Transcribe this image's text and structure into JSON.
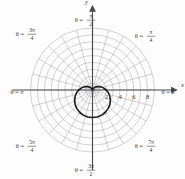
{
  "figure": {
    "kind": "polar-plot",
    "background": "#fdfdfd",
    "grid_color": "#8c8c96",
    "axis_color": "#4a4a4a",
    "curve_color": "#1a1a1a",
    "label_color": "#3a3a3a"
  },
  "axes": {
    "y_axis_label": "y",
    "x_axis_label": "x",
    "x_ticks": [
      "2",
      "4",
      "6",
      "8"
    ],
    "x_tick_values": [
      2,
      4,
      6,
      8
    ]
  },
  "angle_labels": [
    {
      "id": "theta-0",
      "text": "θ = 0",
      "angle_deg": 0,
      "value_rad": 0.0
    },
    {
      "id": "theta-pi-4",
      "text": "θ = π/4",
      "angle_deg": 45,
      "value_rad": 0.7853981634,
      "lhs": "θ =",
      "num": "π",
      "den": "4"
    },
    {
      "id": "theta-pi-2",
      "text": "θ = π/2",
      "angle_deg": 90,
      "value_rad": 1.5707963268,
      "lhs": "θ =",
      "num": "π",
      "den": "2"
    },
    {
      "id": "theta-3pi-4",
      "text": "θ = 3π/4",
      "angle_deg": 135,
      "value_rad": 2.3561944902,
      "lhs": "θ =",
      "num": "3π",
      "den": "4"
    },
    {
      "id": "theta-pi",
      "text": "θ = π",
      "angle_deg": 180,
      "value_rad": 3.1415926536
    },
    {
      "id": "theta-5pi-4",
      "text": "θ = 5π/4",
      "angle_deg": 225,
      "value_rad": 3.926990817,
      "lhs": "θ =",
      "num": "5π",
      "den": "4"
    },
    {
      "id": "theta-3pi-2",
      "text": "θ = 3π/2",
      "angle_deg": 270,
      "value_rad": 4.7123889804,
      "lhs": "θ =",
      "num": "3π",
      "den": "2"
    },
    {
      "id": "theta-7pi-4",
      "text": "θ = 7π/4",
      "angle_deg": 315,
      "value_rad": 5.4977871438,
      "lhs": "θ =",
      "num": "7π",
      "den": "4"
    }
  ],
  "chart_data": {
    "type": "line",
    "coordinate_system": "polar",
    "title": "",
    "xlabel": "x",
    "ylabel": "y",
    "equation": "r = 2(1 - sin θ)",
    "curve_name": "cardioid",
    "orientation": "cusp at origin pointing up, lobe opening downward",
    "rlim": [
      0,
      9
    ],
    "r_grid_circles": [
      1,
      2,
      3,
      4,
      5,
      6,
      7,
      8,
      9
    ],
    "r_tick_labels": [
      "2",
      "4",
      "6",
      "8"
    ],
    "theta_grid_deg": [
      0,
      15,
      30,
      45,
      60,
      75,
      90,
      105,
      120,
      135,
      150,
      165,
      180,
      195,
      210,
      225,
      240,
      255,
      270,
      285,
      300,
      315,
      330,
      345
    ],
    "grid": true,
    "legend": null,
    "theta_deg": [
      0,
      10,
      20,
      30,
      40,
      50,
      60,
      70,
      80,
      90,
      100,
      110,
      120,
      130,
      140,
      150,
      160,
      170,
      180,
      190,
      200,
      210,
      220,
      230,
      240,
      250,
      260,
      270,
      280,
      290,
      300,
      310,
      320,
      330,
      340,
      350,
      360
    ],
    "r": [
      2.0,
      1.65,
      1.32,
      1.0,
      0.71,
      0.47,
      0.27,
      0.12,
      0.03,
      0.0,
      0.03,
      0.12,
      0.27,
      0.47,
      0.71,
      1.0,
      1.32,
      1.65,
      2.0,
      2.35,
      2.68,
      3.0,
      3.29,
      3.53,
      3.73,
      3.88,
      3.97,
      4.0,
      3.97,
      3.88,
      3.73,
      3.53,
      3.29,
      3.0,
      2.68,
      2.35,
      2.0
    ],
    "key_points": [
      {
        "theta_deg": 0,
        "r": 2.0,
        "note": "r = 2 along θ = 0"
      },
      {
        "theta_deg": 90,
        "r": 0.0,
        "note": "cusp at origin, θ = π/2"
      },
      {
        "theta_deg": 180,
        "r": 2.0,
        "note": "r = 2 along θ = π"
      },
      {
        "theta_deg": 270,
        "r": 4.0,
        "note": "maximum r = 4 at θ = 3π/2"
      }
    ]
  }
}
